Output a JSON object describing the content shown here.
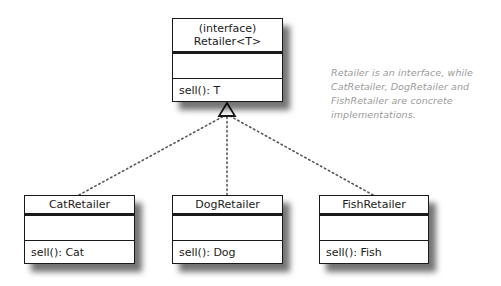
{
  "diagram": {
    "type": "UML class diagram",
    "interface": {
      "stereotype": "(interface)",
      "name": "Retailer<T>",
      "attributes": [],
      "methods": [
        "sell(): T"
      ]
    },
    "implementations": [
      {
        "name": "CatRetailer",
        "attributes": [],
        "methods": [
          "sell(): Cat"
        ]
      },
      {
        "name": "DogRetailer",
        "attributes": [],
        "methods": [
          "sell(): Dog"
        ]
      },
      {
        "name": "FishRetailer",
        "attributes": [],
        "methods": [
          "sell(): Fish"
        ]
      }
    ],
    "relationship": "realization (dotted line, hollow triangle)",
    "annotation": {
      "lines": [
        "Retailer is an interface, while",
        "CatRetailer, DogRetailer and",
        "FishRetailer are concrete",
        "implementations."
      ],
      "color": "#9a9a9a"
    }
  }
}
